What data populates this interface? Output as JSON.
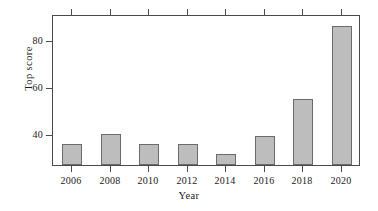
{
  "chart_data": {
    "type": "bar",
    "title": "",
    "xlabel": "Year",
    "ylabel": "Top score",
    "categories": [
      "2006",
      "2008",
      "2010",
      "2012",
      "2014",
      "2016",
      "2018",
      "2020"
    ],
    "values": [
      36,
      40,
      36,
      36,
      31.5,
      39.5,
      55,
      86
    ],
    "ylim": [
      27,
      91
    ],
    "ytick_values": [
      40,
      60,
      80
    ],
    "ytick_labels": [
      "40",
      "60",
      "80"
    ],
    "xtick_labels": [
      "2006",
      "2008",
      "2010",
      "2012",
      "2014",
      "2016",
      "2018",
      "2020"
    ],
    "grid": false,
    "legend": null,
    "bar_color": "#bdbdbd",
    "bar_edge_color": "#6b6b6b",
    "axis_color": "#4a4a4a",
    "background": "#ffffff"
  }
}
